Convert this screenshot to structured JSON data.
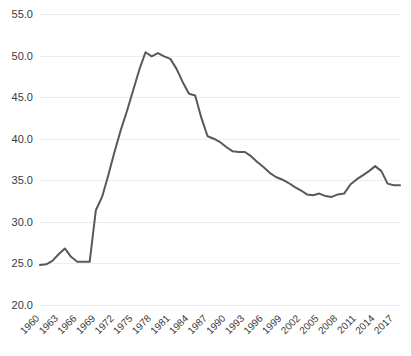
{
  "chart_data": {
    "type": "line",
    "title": "",
    "subtitle": "",
    "xlabel": "",
    "ylabel": "",
    "xlim": [
      1960,
      2018
    ],
    "ylim": [
      20.0,
      55.0
    ],
    "ytick_step": 5.0,
    "xtick_step": 3,
    "grid": true,
    "grid_axis": "y",
    "legend": false,
    "legend_position": "none",
    "line_color": "#595959",
    "grid_color": "#ededed",
    "background_color": "#ffffff",
    "tick_label_color": "#3b3b3b",
    "ytick_labels": [
      "55.0",
      "50.0",
      "45.0",
      "40.0",
      "35.0",
      "30.0",
      "25.0",
      "20.0"
    ],
    "ytick_values": [
      55.0,
      50.0,
      45.0,
      40.0,
      35.0,
      30.0,
      25.0,
      20.0
    ],
    "xtick_labels": [
      "1960",
      "1963",
      "1966",
      "1969",
      "1972",
      "1975",
      "1978",
      "1981",
      "1984",
      "1987",
      "1990",
      "1993",
      "1996",
      "1999",
      "2002",
      "2005",
      "2008",
      "2011",
      "2014",
      "2017"
    ],
    "xtick_values": [
      1960,
      1963,
      1966,
      1969,
      1972,
      1975,
      1978,
      1981,
      1984,
      1987,
      1990,
      1993,
      1996,
      1999,
      2002,
      2005,
      2008,
      2011,
      2014,
      2017
    ],
    "xtick_rotation": -45,
    "x": [
      1960,
      1961,
      1962,
      1963,
      1964,
      1965,
      1966,
      1967,
      1968,
      1969,
      1970,
      1971,
      1972,
      1973,
      1974,
      1975,
      1976,
      1977,
      1978,
      1979,
      1980,
      1981,
      1982,
      1983,
      1984,
      1985,
      1986,
      1987,
      1988,
      1989,
      1990,
      1991,
      1992,
      1993,
      1994,
      1995,
      1996,
      1997,
      1998,
      1999,
      2000,
      2001,
      2002,
      2003,
      2004,
      2005,
      2006,
      2007,
      2008,
      2009,
      2010,
      2011,
      2012,
      2013,
      2014,
      2015,
      2016,
      2017,
      2018
    ],
    "values": [
      24.8,
      24.9,
      25.3,
      26.1,
      26.8,
      25.8,
      25.2,
      25.2,
      25.2,
      31.4,
      33.0,
      35.6,
      38.4,
      41.0,
      43.3,
      45.8,
      48.3,
      50.4,
      49.9,
      50.3,
      49.9,
      49.6,
      48.4,
      46.8,
      45.4,
      45.2,
      42.5,
      40.3,
      40.0,
      39.6,
      39.0,
      38.5,
      38.4,
      38.4,
      37.9,
      37.2,
      36.6,
      35.9,
      35.4,
      35.1,
      34.7,
      34.2,
      33.8,
      33.3,
      33.2,
      33.4,
      33.1,
      33.0,
      33.3,
      33.4,
      34.5,
      35.1,
      35.6,
      36.1,
      36.7,
      36.1,
      34.6,
      34.4,
      34.4
    ],
    "series_name": "series-1"
  }
}
